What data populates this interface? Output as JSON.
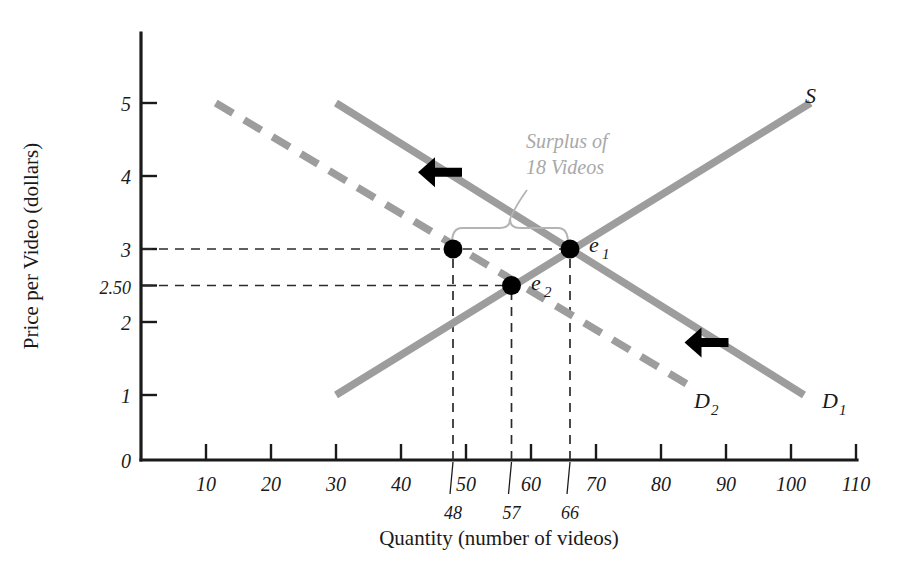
{
  "chart_data": {
    "type": "line",
    "title": "",
    "xlabel": "Quantity (number of videos)",
    "ylabel": "Price per Video (dollars)",
    "xlim": [
      0,
      110
    ],
    "ylim": [
      0,
      5.5
    ],
    "grid": false,
    "legend_position": "inline-curve-labels",
    "x_ticks": [
      "0",
      "10",
      "20",
      "30",
      "40",
      "50",
      "60",
      "70",
      "80",
      "90",
      "100",
      "110"
    ],
    "x_tick_values": [
      0,
      10,
      20,
      30,
      40,
      50,
      60,
      70,
      80,
      90,
      100,
      110
    ],
    "y_ticks": [
      "1",
      "2",
      "2.50",
      "3",
      "4",
      "5"
    ],
    "y_tick_values": [
      1,
      2,
      2.5,
      3,
      4,
      5
    ],
    "special_x_ticks": [
      {
        "label": "48",
        "value": 48
      },
      {
        "label": "57",
        "value": 57
      },
      {
        "label": "66",
        "value": 66
      }
    ],
    "series": [
      {
        "name": "S",
        "label": "S",
        "style": "solid",
        "color": "#9d9d9d",
        "points": [
          [
            30,
            1.0
          ],
          [
            103,
            5.0
          ]
        ],
        "label_position": [
          104,
          5.0
        ]
      },
      {
        "name": "D1",
        "label": "D",
        "label_subscript": "1",
        "style": "solid",
        "color": "#9d9d9d",
        "points": [
          [
            30,
            5.0
          ],
          [
            102,
            1.0
          ]
        ],
        "label_position": [
          105,
          1.0
        ]
      },
      {
        "name": "D2",
        "label": "D",
        "label_subscript": "2",
        "style": "dashed",
        "color": "#9d9d9d",
        "points": [
          [
            11.5,
            5.0
          ],
          [
            84,
            1.15
          ]
        ],
        "label_position": [
          86,
          1.05
        ]
      }
    ],
    "points": [
      {
        "name": "e1",
        "label": "e",
        "subscript": "1",
        "x": 66,
        "y": 3.0,
        "marker": "filled-circle"
      },
      {
        "name": "e2",
        "label": "e",
        "subscript": "2",
        "x": 57,
        "y": 2.5,
        "marker": "filled-circle"
      },
      {
        "name": "surplus-left",
        "label": "",
        "subscript": "",
        "x": 48,
        "y": 3.0,
        "marker": "filled-circle"
      }
    ],
    "guide_lines": [
      {
        "from": [
          0,
          3.0
        ],
        "to": [
          66,
          3.0
        ],
        "style": "dashed",
        "orientation": "horizontal"
      },
      {
        "from": [
          0,
          2.5
        ],
        "to": [
          57,
          2.5
        ],
        "style": "dashed",
        "orientation": "horizontal"
      },
      {
        "from": [
          48,
          0
        ],
        "to": [
          48,
          3.0
        ],
        "style": "dashed",
        "orientation": "vertical"
      },
      {
        "from": [
          57,
          0
        ],
        "to": [
          57,
          2.5
        ],
        "style": "dashed",
        "orientation": "vertical"
      },
      {
        "from": [
          66,
          0
        ],
        "to": [
          66,
          3.0
        ],
        "style": "dashed",
        "orientation": "vertical"
      }
    ],
    "annotations": [
      {
        "name": "surplus-annotation",
        "text_line_1": "Surplus of",
        "text_line_2": "18 Videos",
        "color": "#a8a8a8",
        "brace_span_x": [
          48,
          66
        ],
        "brace_y": 3.0,
        "value": 18
      }
    ],
    "arrows": [
      {
        "name": "demand-shift-arrow-upper",
        "direction": "left",
        "x": 46,
        "y": 4.05
      },
      {
        "name": "demand-shift-arrow-lower",
        "direction": "left",
        "x": 87,
        "y": 1.72
      }
    ],
    "colors": {
      "curve_gray": "#9d9d9d",
      "axis_black": "#1a1a1a",
      "annotation_gray": "#a8a8a8",
      "point_black": "#000000"
    }
  },
  "axes": {
    "x_title": "Quantity (number of videos)",
    "y_title": "Price per Video (dollars)"
  }
}
